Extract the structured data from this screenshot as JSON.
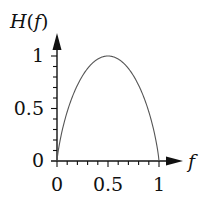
{
  "chart_data": {
    "type": "line",
    "title": "",
    "xlabel": "f",
    "ylabel": "H(f)",
    "xlim": [
      0,
      1
    ],
    "ylim": [
      0,
      1
    ],
    "x_ticks": [
      "0",
      "0.5",
      "1"
    ],
    "y_ticks": [
      "0",
      "0.5",
      "1"
    ],
    "grid": false,
    "legend": null,
    "series": [
      {
        "name": "H(f) binary entropy",
        "x": [
          0,
          0.02,
          0.05,
          0.1,
          0.15,
          0.2,
          0.25,
          0.3,
          0.35,
          0.4,
          0.45,
          0.5,
          0.55,
          0.6,
          0.65,
          0.7,
          0.75,
          0.8,
          0.85,
          0.9,
          0.95,
          0.98,
          1
        ],
        "values": [
          0,
          0.141,
          0.286,
          0.469,
          0.61,
          0.722,
          0.811,
          0.881,
          0.934,
          0.971,
          0.993,
          1,
          0.993,
          0.971,
          0.934,
          0.881,
          0.811,
          0.722,
          0.61,
          0.469,
          0.286,
          0.141,
          0
        ]
      }
    ]
  },
  "labels": {
    "y_axis": "H(f)",
    "x_axis": "f",
    "y_tick_0": "0",
    "y_tick_05": "0.5",
    "y_tick_1": "1",
    "x_tick_0": "0",
    "x_tick_05": "0.5",
    "x_tick_1": "1"
  }
}
